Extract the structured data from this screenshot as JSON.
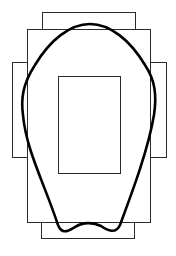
{
  "diagram": {
    "background": "#ffffff",
    "stroke": "#2a2a2a",
    "curve_stroke": "#000000",
    "rects": [
      {
        "name": "top-rect",
        "x": 42,
        "y": 12,
        "w": 93,
        "h": 17
      },
      {
        "name": "upper-body-rect",
        "x": 27,
        "y": 29,
        "w": 123,
        "h": 193
      },
      {
        "name": "left-side-rect",
        "x": 12,
        "y": 62,
        "w": 15,
        "h": 95
      },
      {
        "name": "right-side-rect",
        "x": 150,
        "y": 62,
        "w": 16,
        "h": 95
      },
      {
        "name": "inner-rect",
        "x": 58,
        "y": 76,
        "w": 62,
        "h": 97
      },
      {
        "name": "bottom-rect",
        "x": 41,
        "y": 222,
        "w": 93,
        "h": 16
      }
    ],
    "curve_path": "M 90 24 C 70 24, 50 40, 35 65 C 22 85, 21 100, 23 115 C 26 150, 45 185, 58 225 C 62 235, 68 231, 75 227 C 83 222, 93 222, 101 226 C 108 231, 116 234, 120 225 C 133 190, 148 150, 154 115 C 157 95, 155 80, 145 65 C 130 40, 110 24, 90 24 Z"
  }
}
